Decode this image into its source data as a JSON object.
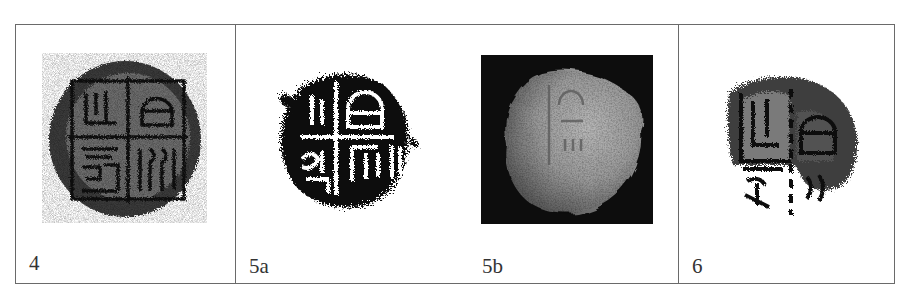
{
  "figure": {
    "panels": [
      {
        "id": "4",
        "label": "4",
        "images": [
          {
            "id": "4",
            "kind": "rubbing",
            "description": "round seal impression with four-quadrant inscription",
            "icon": "coin-rubbing-icon"
          }
        ]
      },
      {
        "id": "5",
        "label": "5a",
        "images": [
          {
            "id": "5a",
            "label": "5a",
            "kind": "rubbing",
            "description": "fragmentary seal impression, high-contrast black rubbing",
            "icon": "coin-rubbing-icon"
          },
          {
            "id": "5b",
            "label": "5b",
            "kind": "photograph",
            "description": "photograph of worn clay object on black background",
            "icon": "coin-photo-icon"
          }
        ]
      },
      {
        "id": "6",
        "label": "6",
        "images": [
          {
            "id": "6",
            "kind": "rubbing",
            "description": "partial seal impression with inscription",
            "icon": "coin-rubbing-icon"
          }
        ]
      }
    ],
    "labels": {
      "p4": "4",
      "p5a": "5a",
      "p5b": "5b",
      "p6": "6"
    },
    "colors": {
      "border": "#6a6a6a",
      "ink": "#1a1a1a",
      "photo_bg": "#0d0d0d",
      "photo_object": "#9a9a9a",
      "label_text": "#333333"
    }
  }
}
